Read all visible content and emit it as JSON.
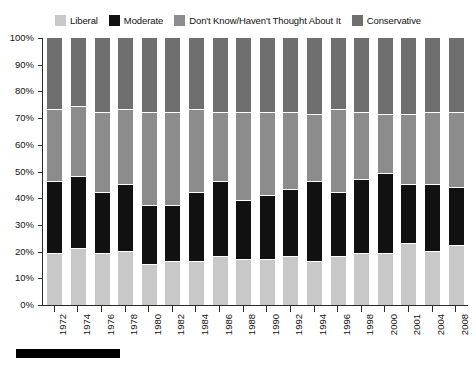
{
  "legend": {
    "position": "top",
    "items": [
      {
        "label": "Liberal",
        "color": "#c8c8c8",
        "swatch_name": "legend-swatch-liberal"
      },
      {
        "label": "Moderate",
        "color": "#111111",
        "swatch_name": "legend-swatch-moderate"
      },
      {
        "label": "Don't Know/Haven't Thought About It",
        "color": "#8c8c8c",
        "swatch_name": "legend-swatch-dont-know"
      },
      {
        "label": "Conservative",
        "color": "#6e6e6e",
        "swatch_name": "legend-swatch-conservative"
      }
    ]
  },
  "axes": {
    "y_ticks": [
      "100%",
      "90%",
      "80%",
      "70%",
      "60%",
      "50%",
      "40%",
      "30%",
      "20%",
      "10%",
      "0%"
    ],
    "y_min": 0,
    "y_max": 100,
    "y_step": 10,
    "grid": false
  },
  "chart_data": {
    "type": "bar",
    "stacked": true,
    "orientation": "vertical",
    "title": "",
    "subtitle": "",
    "xlabel": "",
    "ylabel": "",
    "ylim": [
      0,
      100
    ],
    "ytick_format": "percent",
    "legend_position": "top",
    "categories": [
      "1972",
      "1974",
      "1976",
      "1978",
      "1980",
      "1982",
      "1984",
      "1986",
      "1988",
      "1990",
      "1992",
      "1994",
      "1996",
      "1998",
      "2000",
      "2001",
      "2004",
      "2008"
    ],
    "series": [
      {
        "name": "Liberal",
        "color": "#c8c8c8",
        "values": [
          19,
          21,
          19,
          20,
          15,
          16,
          16,
          18,
          17,
          17,
          18,
          16,
          18,
          19,
          19,
          23,
          20,
          22
        ]
      },
      {
        "name": "Moderate",
        "color": "#111111",
        "values": [
          27,
          27,
          23,
          25,
          22,
          21,
          26,
          28,
          22,
          24,
          25,
          30,
          24,
          28,
          30,
          22,
          25,
          22
        ]
      },
      {
        "name": "Don't Know/Haven't Thought About It",
        "color": "#8c8c8c",
        "values": [
          27,
          26,
          30,
          28,
          35,
          35,
          31,
          26,
          33,
          31,
          29,
          25,
          31,
          25,
          22,
          26,
          27,
          28
        ]
      },
      {
        "name": "Conservative",
        "color": "#6e6e6e",
        "values": [
          27,
          26,
          28,
          27,
          28,
          28,
          27,
          28,
          28,
          28,
          28,
          29,
          27,
          28,
          29,
          29,
          28,
          28
        ]
      }
    ],
    "cumulative_tops": {
      "Liberal": [
        19,
        21,
        19,
        20,
        15,
        16,
        16,
        18,
        17,
        17,
        18,
        16,
        18,
        19,
        19,
        23,
        20,
        22
      ],
      "Moderate": [
        46,
        48,
        42,
        45,
        37,
        37,
        42,
        46,
        39,
        41,
        43,
        46,
        42,
        47,
        49,
        45,
        45,
        44
      ],
      "DontKnow": [
        73,
        74,
        72,
        73,
        72,
        72,
        73,
        72,
        72,
        72,
        72,
        71,
        73,
        72,
        71,
        71,
        72,
        72
      ],
      "Conservative": [
        100,
        100,
        100,
        100,
        100,
        100,
        100,
        100,
        100,
        100,
        100,
        100,
        100,
        100,
        100,
        100,
        100,
        100
      ]
    }
  },
  "colors": {
    "liberal": "#c8c8c8",
    "moderate": "#111111",
    "dont_know": "#8c8c8c",
    "conservative": "#6e6e6e",
    "axis": "#2b2b2b",
    "text": "#111111",
    "background": "#ffffff",
    "rule": "#000000"
  }
}
